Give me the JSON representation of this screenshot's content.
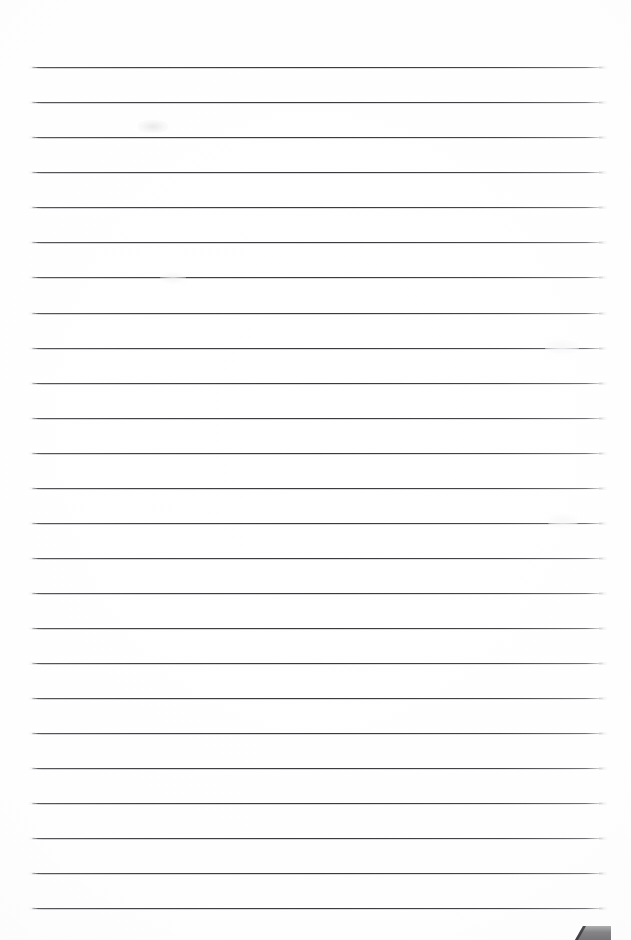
{
  "document": {
    "kind": "scanned-ruled-notebook-page",
    "title": "Blank Ruled Page",
    "page_width": 631,
    "page_height": 940,
    "background_color": "#ffffff",
    "text_content": "",
    "has_handwriting": false
  },
  "ruling": {
    "line_color": "#3a3a3e",
    "halo_color": "#a8a8ac",
    "line_count": 25,
    "left_x": 32,
    "right_x": 603,
    "first_line_y": 67,
    "spacing": 35.05,
    "lines": [
      {
        "index": 1,
        "y": 67,
        "x_start": 32,
        "x_end": 603
      },
      {
        "index": 2,
        "y": 102,
        "x_start": 32,
        "x_end": 603
      },
      {
        "index": 3,
        "y": 137,
        "x_start": 32,
        "x_end": 603
      },
      {
        "index": 4,
        "y": 172,
        "x_start": 32,
        "x_end": 603
      },
      {
        "index": 5,
        "y": 207,
        "x_start": 32,
        "x_end": 603
      },
      {
        "index": 6,
        "y": 242,
        "x_start": 32,
        "x_end": 603
      },
      {
        "index": 7,
        "y": 277,
        "x_start": 32,
        "x_end": 603
      },
      {
        "index": 8,
        "y": 313,
        "x_start": 32,
        "x_end": 603
      },
      {
        "index": 9,
        "y": 348,
        "x_start": 32,
        "x_end": 603
      },
      {
        "index": 10,
        "y": 383,
        "x_start": 32,
        "x_end": 603
      },
      {
        "index": 11,
        "y": 418,
        "x_start": 32,
        "x_end": 603
      },
      {
        "index": 12,
        "y": 453,
        "x_start": 32,
        "x_end": 603
      },
      {
        "index": 13,
        "y": 488,
        "x_start": 32,
        "x_end": 603
      },
      {
        "index": 14,
        "y": 523,
        "x_start": 32,
        "x_end": 603
      },
      {
        "index": 15,
        "y": 558,
        "x_start": 32,
        "x_end": 603
      },
      {
        "index": 16,
        "y": 593,
        "x_start": 32,
        "x_end": 603
      },
      {
        "index": 17,
        "y": 628,
        "x_start": 32,
        "x_end": 603
      },
      {
        "index": 18,
        "y": 663,
        "x_start": 32,
        "x_end": 603
      },
      {
        "index": 19,
        "y": 698,
        "x_start": 32,
        "x_end": 603
      },
      {
        "index": 20,
        "y": 733,
        "x_start": 32,
        "x_end": 603
      },
      {
        "index": 21,
        "y": 768,
        "x_start": 32,
        "x_end": 603
      },
      {
        "index": 22,
        "y": 803,
        "x_start": 32,
        "x_end": 603
      },
      {
        "index": 23,
        "y": 838,
        "x_start": 32,
        "x_end": 603
      },
      {
        "index": 24,
        "y": 873,
        "x_start": 32,
        "x_end": 603
      },
      {
        "index": 25,
        "y": 908,
        "x_start": 32,
        "x_end": 603
      }
    ]
  },
  "artifacts": {
    "smudges": [
      {
        "name": "smudge-upper-left",
        "x": 138,
        "y": 120,
        "width": 30,
        "height": 13
      },
      {
        "name": "smudge-mid-right",
        "x": 545,
        "y": 340,
        "width": 34,
        "height": 14
      },
      {
        "name": "smudge-lower-right",
        "x": 548,
        "y": 514,
        "width": 30,
        "height": 14
      },
      {
        "name": "smudge-lower-left",
        "x": 160,
        "y": 272,
        "width": 26,
        "height": 12
      }
    ],
    "corner_wedge": {
      "name": "page-corner-shadow",
      "x": 575,
      "y": 926,
      "width": 36,
      "height": 14,
      "fill_color": "#6f6f72",
      "edge_color": "#2e2e31"
    }
  }
}
